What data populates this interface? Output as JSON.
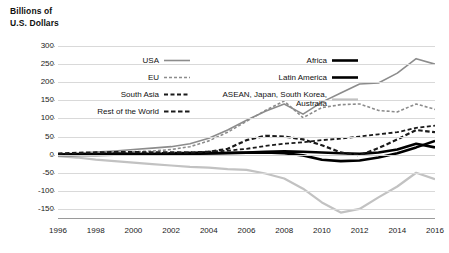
{
  "axis_title": {
    "line1": "Billions of",
    "line2": "U.S. Dollars"
  },
  "colors": {
    "usa": "#8c8c8c",
    "eu": "#8c8c8c",
    "south_asia": "#1a1a1a",
    "rest_of_world": "#1a1a1a",
    "africa": "#000000",
    "latin_america": "#000000",
    "asean": "#c2c2c2",
    "gridline": "#d9d9d9",
    "axis": "#9a9a9a",
    "text": "#111111",
    "background": "#ffffff"
  },
  "legend": {
    "left_items": [
      {
        "label": "USA",
        "key": "usa",
        "style": "solid",
        "color": "#8c8c8c",
        "width": 1.6
      },
      {
        "label": "EU",
        "key": "eu",
        "style": "dashed-fine",
        "color": "#8c8c8c",
        "width": 1.6
      },
      {
        "label": "South Asia",
        "key": "south_asia",
        "style": "dashed",
        "color": "#1a1a1a",
        "width": 1.8
      },
      {
        "label": "Rest of the World",
        "key": "rest_of_world",
        "style": "dashed-bold",
        "color": "#1a1a1a",
        "width": 2.2
      }
    ],
    "right_items": [
      {
        "label": "Africa",
        "key": "africa",
        "style": "solid",
        "color": "#000000",
        "width": 2.6
      },
      {
        "label": "Latin America",
        "key": "latin_america",
        "style": "solid",
        "color": "#000000",
        "width": 2.6
      },
      {
        "label": "ASEAN, Japan, South Korea, Australia",
        "key": "asean",
        "style": "solid",
        "color": "#c2c2c2",
        "width": 2.2
      }
    ]
  },
  "chart_data": {
    "type": "line",
    "title": "",
    "subtitle": "",
    "xlabel": "",
    "ylabel": "Billions of U.S. Dollars",
    "xlim": [
      1996,
      2016
    ],
    "ylim": [
      -175,
      300
    ],
    "grid": true,
    "legend_position": "top-left-inside",
    "x": [
      1996,
      1997,
      1998,
      1999,
      2000,
      2001,
      2002,
      2003,
      2004,
      2005,
      2006,
      2007,
      2008,
      2009,
      2010,
      2011,
      2012,
      2013,
      2014,
      2015,
      2016
    ],
    "yticks": [
      300,
      250,
      200,
      150,
      100,
      50,
      0,
      -50,
      -100,
      -150
    ],
    "ytick_labels": [
      "300",
      "250",
      "200",
      "150",
      "100",
      "50",
      "0",
      "-50",
      "-100",
      "-150"
    ],
    "xticks": [
      1996,
      1998,
      2000,
      2002,
      2004,
      2006,
      2008,
      2010,
      2012,
      2014,
      2016
    ],
    "xtick_labels": [
      "1996",
      "1998",
      "2000",
      "2002",
      "2004",
      "2006",
      "2008",
      "2010",
      "2012",
      "2014",
      "2016"
    ],
    "series": [
      {
        "name": "USA",
        "key": "usa",
        "color": "#8c8c8c",
        "style": "solid",
        "width": 1.6,
        "values": [
          2,
          4,
          7,
          10,
          14,
          18,
          22,
          30,
          45,
          68,
          95,
          120,
          140,
          112,
          145,
          170,
          195,
          198,
          225,
          265,
          250
        ]
      },
      {
        "name": "EU",
        "key": "eu",
        "color": "#8c8c8c",
        "style": "dashed-fine",
        "width": 1.6,
        "values": [
          0,
          2,
          4,
          6,
          8,
          10,
          14,
          22,
          38,
          62,
          92,
          122,
          148,
          102,
          130,
          138,
          140,
          122,
          118,
          140,
          125
        ]
      },
      {
        "name": "South Asia",
        "key": "south_asia",
        "color": "#1a1a1a",
        "style": "dashed",
        "width": 1.8,
        "values": [
          1,
          2,
          2,
          3,
          3,
          4,
          5,
          6,
          8,
          11,
          16,
          24,
          30,
          34,
          40,
          44,
          50,
          56,
          62,
          74,
          80
        ]
      },
      {
        "name": "Rest of the World",
        "key": "rest_of_world",
        "color": "#1a1a1a",
        "style": "dashed-bold",
        "width": 2.2,
        "values": [
          3,
          5,
          6,
          7,
          7,
          6,
          6,
          6,
          8,
          16,
          40,
          52,
          50,
          42,
          26,
          6,
          -2,
          18,
          42,
          68,
          62
        ]
      },
      {
        "name": "Africa",
        "key": "africa",
        "color": "#000000",
        "style": "solid",
        "width": 2.6,
        "values": [
          0,
          1,
          1,
          2,
          2,
          2,
          2,
          3,
          4,
          5,
          6,
          8,
          9,
          8,
          6,
          4,
          2,
          6,
          14,
          30,
          20
        ]
      },
      {
        "name": "Latin America",
        "key": "latin_america",
        "color": "#000000",
        "style": "solid",
        "width": 2.6,
        "values": [
          -1,
          -1,
          -1,
          0,
          0,
          1,
          1,
          2,
          3,
          4,
          5,
          6,
          4,
          -2,
          -14,
          -18,
          -16,
          -8,
          4,
          20,
          38
        ]
      },
      {
        "name": "ASEAN, Japan, South Korea, Australia",
        "key": "asean",
        "color": "#c2c2c2",
        "style": "solid",
        "width": 2.2,
        "values": [
          -4,
          -8,
          -14,
          -18,
          -22,
          -26,
          -30,
          -34,
          -36,
          -40,
          -42,
          -52,
          -66,
          -94,
          -132,
          -160,
          -150,
          -118,
          -88,
          -50,
          -68
        ]
      }
    ]
  }
}
